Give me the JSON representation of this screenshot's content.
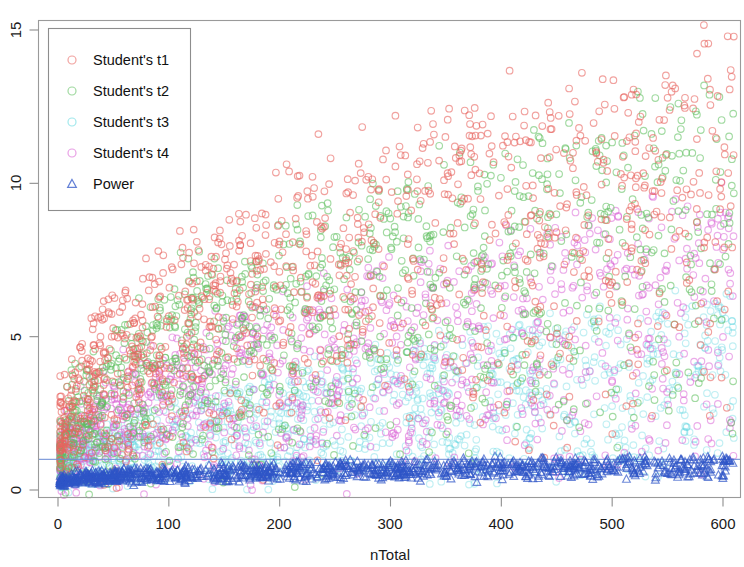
{
  "chart_data": {
    "type": "scatter",
    "title": "",
    "xlabel": "nTotal",
    "ylabel": "",
    "xlim": [
      -10,
      615
    ],
    "ylim": [
      -1.2,
      15.6
    ],
    "xticks": [
      0,
      100,
      200,
      300,
      400,
      500,
      600
    ],
    "yticks": [
      0,
      5,
      10,
      15
    ],
    "xtick_labels": [
      "0",
      "100",
      "200",
      "300",
      "400",
      "500",
      "600"
    ],
    "ytick_labels": [
      "0",
      "5",
      "10",
      "15"
    ],
    "grid": false,
    "legend_position": "top-left",
    "reference_lines": [
      {
        "name": "power-reference-line",
        "orientation": "horizontal",
        "y": 1.0,
        "color": "#6f8fd6"
      }
    ],
    "series": [
      {
        "name": "Student's t1",
        "key": "t1",
        "marker": "circle",
        "color": "#e8645f",
        "count": 1100,
        "y_range": [
          0,
          15.2
        ],
        "trend": "rises steeply with nTotal, saturating near 15"
      },
      {
        "name": "Student's t2",
        "key": "t2",
        "marker": "circle",
        "color": "#5fbf5f",
        "count": 1100,
        "y_range": [
          0,
          15.0
        ],
        "trend": "rises with nTotal, slightly below t1"
      },
      {
        "name": "Student's t3",
        "key": "t3",
        "marker": "circle",
        "color": "#63d8e0",
        "count": 1100,
        "y_range": [
          0,
          9.0
        ],
        "trend": "low spread, mostly under 5"
      },
      {
        "name": "Student's t4",
        "key": "t4",
        "marker": "circle",
        "color": "#d95fd4",
        "count": 1100,
        "y_range": [
          0,
          12.5
        ],
        "trend": "moderate rise, mostly under 8"
      },
      {
        "name": "Power",
        "key": "power",
        "marker": "triangle",
        "color": "#2f55c8",
        "count": 1100,
        "y_range": [
          0,
          1.1
        ],
        "trend": "flat band between 0 and 1"
      }
    ],
    "legend_entries": [
      {
        "label": "Student's t1",
        "marker": "circle",
        "color": "#e8645f"
      },
      {
        "label": "Student's t2",
        "marker": "circle",
        "color": "#5fbf5f"
      },
      {
        "label": "Student's t3",
        "marker": "circle",
        "color": "#63d8e0"
      },
      {
        "label": "Student's t4",
        "marker": "circle",
        "color": "#d95fd4"
      },
      {
        "label": "Power",
        "marker": "triangle",
        "color": "#2f55c8"
      }
    ]
  },
  "axes": {
    "x_title": "nTotal",
    "x_tick_0": "0",
    "x_tick_1": "100",
    "x_tick_2": "200",
    "x_tick_3": "300",
    "x_tick_4": "400",
    "x_tick_5": "500",
    "x_tick_6": "600",
    "y_tick_0": "0",
    "y_tick_1": "5",
    "y_tick_2": "10",
    "y_tick_3": "15"
  },
  "legend": {
    "entry_0": "Student's t1",
    "entry_1": "Student's t2",
    "entry_2": "Student's t3",
    "entry_3": "Student's t4",
    "entry_4": "Power"
  }
}
